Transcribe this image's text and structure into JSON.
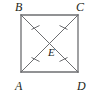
{
  "figure": {
    "shape": "square",
    "stroke_color": "#6d6e71",
    "label_color": "#231f20",
    "background": "#ffffff",
    "stroke_width": 1.2,
    "tick_mark_count_per_half_diagonal": 1,
    "vertices": [
      {
        "id": "B",
        "label": "B",
        "position": "top-left",
        "x": 21,
        "y": 15
      },
      {
        "id": "C",
        "label": "C",
        "position": "top-right",
        "x": 78,
        "y": 15
      },
      {
        "id": "D",
        "label": "D",
        "position": "bottom-right",
        "x": 78,
        "y": 72
      },
      {
        "id": "A",
        "label": "A",
        "position": "bottom-left",
        "x": 21,
        "y": 72
      }
    ],
    "interior_point": {
      "id": "E",
      "label": "E",
      "x": 49.5,
      "y": 43.5
    },
    "sides": [
      {
        "name": "BC",
        "from": "B",
        "to": "C"
      },
      {
        "name": "CD",
        "from": "C",
        "to": "D"
      },
      {
        "name": "DA",
        "from": "D",
        "to": "A"
      },
      {
        "name": "AB",
        "from": "A",
        "to": "B"
      }
    ],
    "diagonals": [
      {
        "name": "BD",
        "from": "B",
        "to": "D"
      },
      {
        "name": "AC",
        "from": "A",
        "to": "C"
      }
    ],
    "congruence_marks": [
      {
        "segment": "BE",
        "ticks": 1
      },
      {
        "segment": "CE",
        "ticks": 1
      },
      {
        "segment": "AE",
        "ticks": 1
      },
      {
        "segment": "DE",
        "ticks": 1
      }
    ]
  }
}
